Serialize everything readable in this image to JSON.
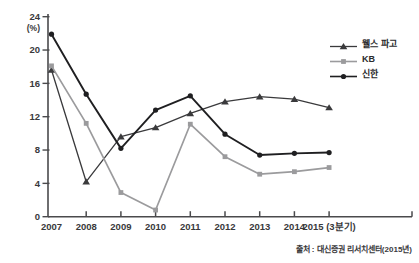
{
  "figure": {
    "background": "#ffffff",
    "axis_color": "#4a4a4c",
    "tick_label_color": "#39393b"
  },
  "chart_data": {
    "type": "line",
    "title": "",
    "xlabel": "",
    "ylabel": "(%)",
    "ylim": [
      0,
      24
    ],
    "yticks": [
      0,
      4,
      8,
      12,
      16,
      20,
      24
    ],
    "grid": false,
    "legend_position": "top-right",
    "categories": [
      "2007",
      "2008",
      "2009",
      "2010",
      "2011",
      "2012",
      "2013",
      "2014",
      "2015 (3분기)"
    ],
    "series": [
      {
        "name": "웰스 파고",
        "slug": "wells-fargo",
        "color": "#3a3a3c",
        "marker": "triangle",
        "line_width": 1.3,
        "values": [
          17.6,
          4.2,
          9.6,
          10.7,
          12.4,
          13.8,
          14.4,
          14.1,
          13.1
        ]
      },
      {
        "name": "KB",
        "slug": "kb",
        "color": "#9b9b9d",
        "marker": "square",
        "line_width": 1.7,
        "values": [
          18.1,
          11.2,
          2.9,
          0.8,
          11.1,
          7.2,
          5.1,
          5.4,
          5.9
        ]
      },
      {
        "name": "신한",
        "slug": "shinhan",
        "color": "#1f1f21",
        "marker": "circle",
        "line_width": 1.9,
        "values": [
          21.9,
          14.7,
          8.2,
          12.8,
          14.5,
          9.9,
          7.4,
          7.6,
          7.7
        ]
      }
    ],
    "source": "출처 : 대신증권 리서치센터(2015년)"
  }
}
